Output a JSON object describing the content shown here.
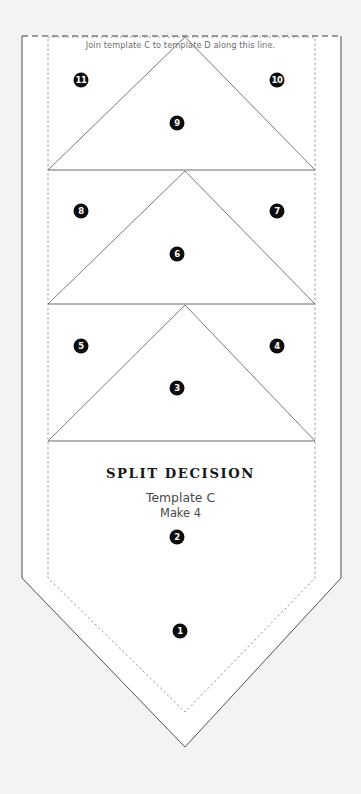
{
  "page": {
    "background_color": "#f3f3f3",
    "paper_color": "#ffffff",
    "line_color": "#555555",
    "seam_color": "#888888",
    "badge_color": "#0d0d0d",
    "badge_text_color": "#ffffff"
  },
  "note": {
    "join_line_text": "Join template C to template D along this line."
  },
  "title": {
    "name": "SPLIT DECISION",
    "template": "Template C",
    "quantity": "Make 4"
  },
  "badges": [
    {
      "label": "11",
      "x": 81,
      "y": 80
    },
    {
      "label": "10",
      "x": 277,
      "y": 80
    },
    {
      "label": "9",
      "x": 177,
      "y": 123
    },
    {
      "label": "8",
      "x": 81,
      "y": 211
    },
    {
      "label": "7",
      "x": 277,
      "y": 211
    },
    {
      "label": "6",
      "x": 177,
      "y": 254
    },
    {
      "label": "5",
      "x": 81,
      "y": 346
    },
    {
      "label": "4",
      "x": 277,
      "y": 346
    },
    {
      "label": "3",
      "x": 177,
      "y": 388
    },
    {
      "label": "2",
      "x": 177,
      "y": 537
    },
    {
      "label": "1",
      "x": 180,
      "y": 631
    }
  ],
  "geometry": {
    "outer_outline_points": "22,36 341,36 341,578 185,747 22,578",
    "seam_outline_points": "48,37 315,37 315,578 185,712 48,578",
    "band_lines_y": [
      170,
      304,
      441
    ],
    "triangles": [
      {
        "id": "t9",
        "points": "48,170 185,37 315,170"
      },
      {
        "id": "t6",
        "points": "48,304 185,171 315,304"
      },
      {
        "id": "t3",
        "points": "48,441 185,305 315,441"
      }
    ]
  }
}
